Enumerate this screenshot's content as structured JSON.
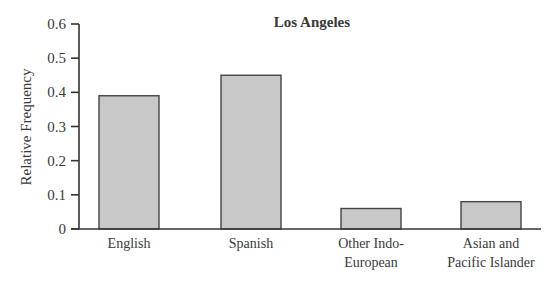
{
  "chart_data": {
    "type": "bar",
    "title": "Los Angeles",
    "xlabel": "",
    "ylabel": "Relative Frequency",
    "ylim": [
      0,
      0.6
    ],
    "yticks": [
      0,
      0.1,
      0.2,
      0.3,
      0.4,
      0.5,
      0.6
    ],
    "ytick_labels": [
      "0",
      "0.1",
      "0.2",
      "0.3",
      "0.4",
      "0.5",
      "0.6"
    ],
    "categories": [
      "English",
      "Spanish",
      "Other Indo-European",
      "Asian and Pacific Islander"
    ],
    "category_label_lines": [
      [
        "English"
      ],
      [
        "Spanish"
      ],
      [
        "Other Indo-",
        "European"
      ],
      [
        "Asian and",
        "Pacific Islander"
      ]
    ],
    "values": [
      0.39,
      0.45,
      0.06,
      0.08
    ],
    "grid": false,
    "legend": null,
    "bar_color": "#c8c8c8",
    "bar_edge_color": "#444444"
  }
}
